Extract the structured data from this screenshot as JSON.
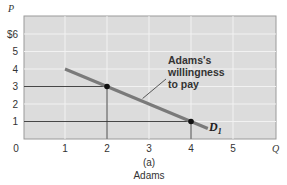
{
  "chart_data": {
    "type": "line",
    "title": "",
    "panel_label": "(a)",
    "caption": "Adams",
    "xlabel": "Q",
    "ylabel": "P",
    "xlim": [
      0,
      6
    ],
    "ylim": [
      0,
      7
    ],
    "x_ticks": [
      "0",
      "1",
      "2",
      "3",
      "4",
      "5"
    ],
    "y_ticks": [
      "$6",
      "5",
      "4",
      "3",
      "2",
      "1"
    ],
    "grid": true,
    "series": [
      {
        "name": "D1",
        "label": "D",
        "label_subscript": "1",
        "points": [
          [
            1,
            4
          ],
          [
            4.4,
            0.6
          ]
        ]
      }
    ],
    "highlighted_points": [
      {
        "x": 2,
        "y": 3
      },
      {
        "x": 4,
        "y": 1
      }
    ],
    "annotation": {
      "lines": [
        "Adams's",
        "willingness",
        "to pay"
      ],
      "points_to": [
        2.8,
        2.2
      ]
    }
  }
}
